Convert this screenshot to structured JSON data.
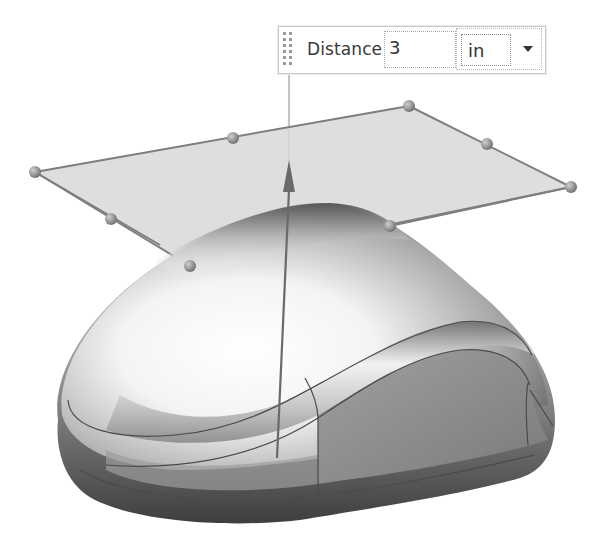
{
  "viewport": {
    "description": "3D CAD view of a computer mouse body with an offset datum plane preview",
    "colors": {
      "plane_fill": "#d6d6d6",
      "plane_edge": "#7e7e7e",
      "handle": "#8a8a8a",
      "arrow": "#6a6a6a",
      "body_light": "#ffffff",
      "body_dark": "#5a5a5a",
      "side_panel": "#8f8f8f",
      "edge_line": "#4e4e4e"
    },
    "plane": {
      "corners": [
        [
          35,
          172
        ],
        [
          409,
          106
        ],
        [
          571,
          187
        ],
        [
          190,
          266
        ]
      ],
      "handles": [
        {
          "name": "corner-left",
          "x": 35,
          "y": 172
        },
        {
          "name": "edge-mid-top-left",
          "x": 233,
          "y": 138
        },
        {
          "name": "corner-top",
          "x": 409,
          "y": 106
        },
        {
          "name": "edge-mid-top-right",
          "x": 487,
          "y": 144
        },
        {
          "name": "corner-right",
          "x": 571,
          "y": 187
        },
        {
          "name": "edge-mid-bottom-right",
          "x": 390,
          "y": 226
        },
        {
          "name": "edge-mid-left",
          "x": 111,
          "y": 219
        },
        {
          "name": "corner-bottom",
          "x": 190,
          "y": 266
        }
      ]
    },
    "direction_arrow": {
      "tail": [
        277,
        458
      ],
      "head": [
        289,
        160
      ]
    }
  },
  "minidialog": {
    "label": "Distance",
    "value": "3",
    "unit": "in",
    "unit_icon": "chevron-down-icon",
    "grip_icon": "grip-dots-icon"
  }
}
